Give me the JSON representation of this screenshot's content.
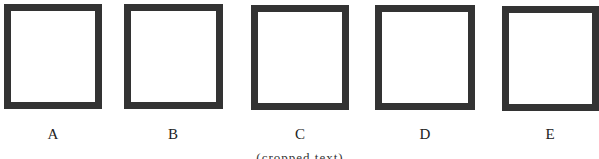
{
  "figure": {
    "options": [
      {
        "label": "A",
        "shape": "square-outline",
        "box": {
          "left": 4,
          "top": 4,
          "width": 98,
          "height": 105
        },
        "label_pos": {
          "left": 33,
          "top": 125
        }
      },
      {
        "label": "B",
        "shape": "square-outline",
        "box": {
          "left": 124,
          "top": 4,
          "width": 99,
          "height": 105
        },
        "label_pos": {
          "left": 153,
          "top": 125
        }
      },
      {
        "label": "C",
        "shape": "square-outline",
        "box": {
          "left": 251,
          "top": 5,
          "width": 98,
          "height": 105
        },
        "label_pos": {
          "left": 280,
          "top": 125
        }
      },
      {
        "label": "D",
        "shape": "square-outline",
        "box": {
          "left": 375,
          "top": 5,
          "width": 100,
          "height": 105
        },
        "label_pos": {
          "left": 405,
          "top": 125
        }
      },
      {
        "label": "E",
        "shape": "square-outline",
        "box": {
          "left": 502,
          "top": 6,
          "width": 97,
          "height": 105
        },
        "label_pos": {
          "left": 530,
          "top": 125
        }
      }
    ],
    "border_color": "#333333",
    "caption": "(cropped text)"
  }
}
